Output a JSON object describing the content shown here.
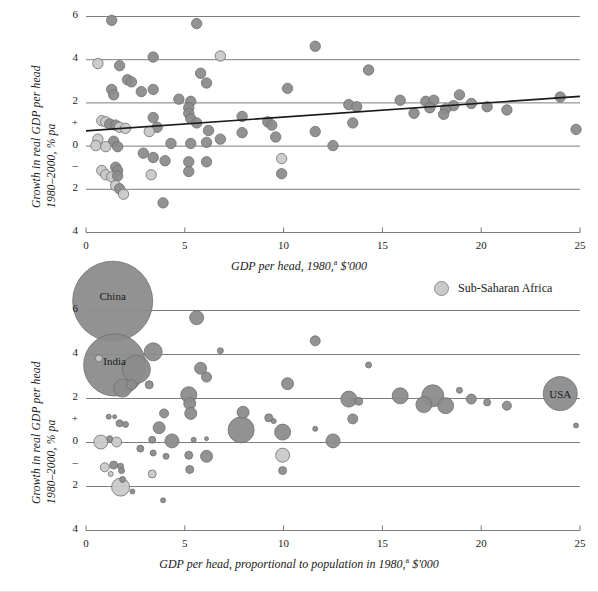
{
  "legend": {
    "label": "Sub-Saharan Africa",
    "marker_color": "#c9c9c9"
  },
  "colors": {
    "bubble_default": "#8c8c8c",
    "bubble_africa": "#c9c9c9",
    "bubble_stroke": "#6f6f6f",
    "gridline": "#7d7d7d",
    "trendline": "#1a1a1a"
  },
  "chart_data": [
    {
      "id": "top",
      "type": "scatter",
      "title": "",
      "xlabel": "GDP per head, 1980,",
      "xlabel_sup": "a",
      "xlabel_tail": " $'000",
      "ylabel_line1": "Growth in real GDP per head",
      "ylabel_line2": "1980–2000, % pa",
      "xlim": [
        0,
        25
      ],
      "ylim": [
        -4,
        6
      ],
      "xticks": [
        0,
        5,
        10,
        15,
        20,
        25
      ],
      "xticklabels": [
        "0",
        "5",
        "10",
        "15",
        "20",
        "25"
      ],
      "yticks": [
        6,
        4,
        2,
        1,
        0,
        -1,
        -2,
        -4
      ],
      "yticklabels": [
        "6",
        "4",
        "2",
        "+",
        "0",
        "–",
        "2",
        "4"
      ],
      "gridlines": [
        6,
        4,
        2,
        0,
        -2,
        -4
      ],
      "grid": true,
      "trendline": {
        "x0": 0.0,
        "y0": 0.68,
        "x1": 25.0,
        "y1": 2.28
      },
      "points": [
        {
          "x": 1.3,
          "y": 5.8,
          "g": "o"
        },
        {
          "x": 5.6,
          "y": 5.65,
          "g": "o"
        },
        {
          "x": 11.6,
          "y": 4.6,
          "g": "o"
        },
        {
          "x": 3.4,
          "y": 4.1,
          "g": "o"
        },
        {
          "x": 6.8,
          "y": 4.15,
          "g": "a"
        },
        {
          "x": 0.6,
          "y": 3.8,
          "g": "a"
        },
        {
          "x": 1.7,
          "y": 3.7,
          "g": "o"
        },
        {
          "x": 14.3,
          "y": 3.5,
          "g": "o"
        },
        {
          "x": 5.8,
          "y": 3.35,
          "g": "o"
        },
        {
          "x": 2.1,
          "y": 3.05,
          "g": "o"
        },
        {
          "x": 2.3,
          "y": 2.95,
          "g": "o"
        },
        {
          "x": 6.1,
          "y": 2.9,
          "g": "o"
        },
        {
          "x": 1.3,
          "y": 2.6,
          "g": "o"
        },
        {
          "x": 1.4,
          "y": 2.35,
          "g": "o"
        },
        {
          "x": 2.8,
          "y": 2.5,
          "g": "o"
        },
        {
          "x": 3.4,
          "y": 2.6,
          "g": "o"
        },
        {
          "x": 10.2,
          "y": 2.65,
          "g": "o"
        },
        {
          "x": 18.9,
          "y": 2.35,
          "g": "o"
        },
        {
          "x": 24.0,
          "y": 2.25,
          "g": "o"
        },
        {
          "x": 4.7,
          "y": 2.15,
          "g": "o"
        },
        {
          "x": 5.3,
          "y": 2.05,
          "g": "o"
        },
        {
          "x": 15.9,
          "y": 2.1,
          "g": "o"
        },
        {
          "x": 17.2,
          "y": 2.05,
          "g": "o"
        },
        {
          "x": 17.6,
          "y": 2.1,
          "g": "o"
        },
        {
          "x": 19.5,
          "y": 1.95,
          "g": "o"
        },
        {
          "x": 18.6,
          "y": 1.85,
          "g": "o"
        },
        {
          "x": 5.2,
          "y": 1.75,
          "g": "o"
        },
        {
          "x": 13.3,
          "y": 1.9,
          "g": "o"
        },
        {
          "x": 13.7,
          "y": 1.8,
          "g": "o"
        },
        {
          "x": 17.4,
          "y": 1.75,
          "g": "o"
        },
        {
          "x": 18.2,
          "y": 1.7,
          "g": "o"
        },
        {
          "x": 20.3,
          "y": 1.8,
          "g": "o"
        },
        {
          "x": 21.3,
          "y": 1.65,
          "g": "o"
        },
        {
          "x": 5.2,
          "y": 1.5,
          "g": "o"
        },
        {
          "x": 16.6,
          "y": 1.5,
          "g": "o"
        },
        {
          "x": 18.1,
          "y": 1.45,
          "g": "o"
        },
        {
          "x": 3.4,
          "y": 1.3,
          "g": "o"
        },
        {
          "x": 5.3,
          "y": 1.25,
          "g": "o"
        },
        {
          "x": 7.9,
          "y": 1.35,
          "g": "o"
        },
        {
          "x": 0.8,
          "y": 1.15,
          "g": "a"
        },
        {
          "x": 1.0,
          "y": 1.1,
          "g": "a"
        },
        {
          "x": 1.2,
          "y": 1.0,
          "g": "o"
        },
        {
          "x": 1.5,
          "y": 0.95,
          "g": "o"
        },
        {
          "x": 1.7,
          "y": 0.85,
          "g": "a"
        },
        {
          "x": 2.0,
          "y": 0.8,
          "g": "a"
        },
        {
          "x": 5.6,
          "y": 1.05,
          "g": "o"
        },
        {
          "x": 9.2,
          "y": 1.1,
          "g": "o"
        },
        {
          "x": 9.4,
          "y": 0.95,
          "g": "o"
        },
        {
          "x": 13.5,
          "y": 1.05,
          "g": "o"
        },
        {
          "x": 3.6,
          "y": 0.85,
          "g": "o"
        },
        {
          "x": 3.2,
          "y": 0.65,
          "g": "a"
        },
        {
          "x": 6.2,
          "y": 0.7,
          "g": "o"
        },
        {
          "x": 7.9,
          "y": 0.6,
          "g": "o"
        },
        {
          "x": 11.6,
          "y": 0.65,
          "g": "o"
        },
        {
          "x": 24.8,
          "y": 0.75,
          "g": "o"
        },
        {
          "x": 0.6,
          "y": 0.3,
          "g": "a"
        },
        {
          "x": 1.4,
          "y": 0.2,
          "g": "o"
        },
        {
          "x": 4.3,
          "y": 0.1,
          "g": "o"
        },
        {
          "x": 5.3,
          "y": 0.1,
          "g": "o"
        },
        {
          "x": 6.1,
          "y": 0.15,
          "g": "o"
        },
        {
          "x": 6.8,
          "y": 0.3,
          "g": "o"
        },
        {
          "x": 9.6,
          "y": 0.4,
          "g": "o"
        },
        {
          "x": 0.5,
          "y": 0.0,
          "g": "a"
        },
        {
          "x": 1.0,
          "y": -0.05,
          "g": "a"
        },
        {
          "x": 1.6,
          "y": -0.05,
          "g": "o"
        },
        {
          "x": 12.5,
          "y": 0.0,
          "g": "o"
        },
        {
          "x": 2.9,
          "y": -0.35,
          "g": "o"
        },
        {
          "x": 3.4,
          "y": -0.55,
          "g": "o"
        },
        {
          "x": 4.0,
          "y": -0.7,
          "g": "o"
        },
        {
          "x": 5.2,
          "y": -0.75,
          "g": "o"
        },
        {
          "x": 6.1,
          "y": -0.75,
          "g": "o"
        },
        {
          "x": 9.9,
          "y": -0.6,
          "g": "a"
        },
        {
          "x": 3.3,
          "y": -1.35,
          "g": "a"
        },
        {
          "x": 5.2,
          "y": -1.2,
          "g": "o"
        },
        {
          "x": 9.9,
          "y": -1.3,
          "g": "o"
        },
        {
          "x": 0.8,
          "y": -1.15,
          "g": "a"
        },
        {
          "x": 1.5,
          "y": -1.0,
          "g": "o"
        },
        {
          "x": 1.6,
          "y": -1.15,
          "g": "o"
        },
        {
          "x": 1.0,
          "y": -1.35,
          "g": "a"
        },
        {
          "x": 1.3,
          "y": -1.45,
          "g": "a"
        },
        {
          "x": 1.6,
          "y": -1.4,
          "g": "o"
        },
        {
          "x": 1.5,
          "y": -1.85,
          "g": "a"
        },
        {
          "x": 1.7,
          "y": -2.0,
          "g": "o"
        },
        {
          "x": 1.9,
          "y": -2.25,
          "g": "a"
        },
        {
          "x": 3.9,
          "y": -2.65,
          "g": "o"
        }
      ]
    },
    {
      "id": "bottom",
      "type": "bubble",
      "title": "",
      "xlabel": "GDP per head, proportional to population in 1980,",
      "xlabel_sup": "a",
      "xlabel_tail": " $'000",
      "ylabel_line1": "Growth in real GDP per head",
      "ylabel_line2": "1980–2000, % pa",
      "xlim": [
        0,
        25
      ],
      "ylim": [
        -4,
        6
      ],
      "xticks": [
        0,
        5,
        10,
        15,
        20,
        25
      ],
      "xticklabels": [
        "0",
        "5",
        "10",
        "15",
        "20",
        "25"
      ],
      "yticks": [
        6,
        4,
        2,
        1,
        0,
        -1,
        -2,
        -4
      ],
      "yticklabels": [
        "6",
        "4",
        "2",
        "+",
        "0",
        "–",
        "2",
        "4"
      ],
      "gridlines": [
        6,
        4,
        2,
        0,
        -2,
        -4
      ],
      "grid": true,
      "size_note": "bubble area proportional to population in 1980",
      "labeled_bubbles": [
        "China",
        "India",
        "USA"
      ],
      "points": [
        {
          "x": 1.35,
          "y": 6.4,
          "r": 40,
          "g": "o",
          "label": "China"
        },
        {
          "x": 1.45,
          "y": 3.5,
          "r": 31,
          "g": "o",
          "label": "India"
        },
        {
          "x": 24.0,
          "y": 2.2,
          "r": 17,
          "g": "o",
          "label": "USA"
        },
        {
          "x": 5.6,
          "y": 5.65,
          "r": 7,
          "g": "o"
        },
        {
          "x": 11.6,
          "y": 4.6,
          "r": 5,
          "g": "o"
        },
        {
          "x": 3.4,
          "y": 4.1,
          "r": 9,
          "g": "o"
        },
        {
          "x": 6.8,
          "y": 4.15,
          "r": 3,
          "g": "o"
        },
        {
          "x": 0.65,
          "y": 3.8,
          "r": 3.5,
          "g": "a"
        },
        {
          "x": 2.55,
          "y": 3.3,
          "r": 14,
          "g": "o"
        },
        {
          "x": 14.3,
          "y": 3.5,
          "r": 3,
          "g": "o"
        },
        {
          "x": 5.8,
          "y": 3.35,
          "r": 6,
          "g": "o"
        },
        {
          "x": 6.1,
          "y": 2.95,
          "r": 5,
          "g": "o"
        },
        {
          "x": 1.85,
          "y": 2.45,
          "r": 9,
          "g": "o"
        },
        {
          "x": 2.3,
          "y": 2.6,
          "r": 5,
          "g": "o"
        },
        {
          "x": 3.2,
          "y": 2.6,
          "r": 4,
          "g": "o"
        },
        {
          "x": 10.2,
          "y": 2.65,
          "r": 6,
          "g": "o"
        },
        {
          "x": 18.9,
          "y": 2.35,
          "r": 3,
          "g": "o"
        },
        {
          "x": 5.2,
          "y": 2.15,
          "r": 8,
          "g": "o"
        },
        {
          "x": 15.9,
          "y": 2.1,
          "r": 8,
          "g": "o"
        },
        {
          "x": 17.55,
          "y": 2.1,
          "r": 11,
          "g": "o"
        },
        {
          "x": 13.3,
          "y": 1.95,
          "r": 8,
          "g": "o"
        },
        {
          "x": 13.8,
          "y": 1.85,
          "r": 4,
          "g": "o"
        },
        {
          "x": 19.5,
          "y": 1.95,
          "r": 5,
          "g": "o"
        },
        {
          "x": 5.25,
          "y": 1.75,
          "r": 6,
          "g": "o"
        },
        {
          "x": 17.1,
          "y": 1.7,
          "r": 8,
          "g": "o"
        },
        {
          "x": 18.2,
          "y": 1.65,
          "r": 8,
          "g": "o"
        },
        {
          "x": 20.3,
          "y": 1.8,
          "r": 3.5,
          "g": "o"
        },
        {
          "x": 21.3,
          "y": 1.65,
          "r": 4.5,
          "g": "o"
        },
        {
          "x": 5.3,
          "y": 1.3,
          "r": 6,
          "g": "o"
        },
        {
          "x": 3.95,
          "y": 1.3,
          "r": 4.5,
          "g": "o"
        },
        {
          "x": 7.95,
          "y": 1.35,
          "r": 6,
          "g": "o"
        },
        {
          "x": 9.25,
          "y": 1.1,
          "r": 4,
          "g": "o"
        },
        {
          "x": 9.5,
          "y": 0.95,
          "r": 2.5,
          "g": "o"
        },
        {
          "x": 13.5,
          "y": 1.05,
          "r": 5,
          "g": "o"
        },
        {
          "x": 1.15,
          "y": 1.15,
          "r": 2.5,
          "g": "o"
        },
        {
          "x": 1.45,
          "y": 1.15,
          "r": 2,
          "g": "o"
        },
        {
          "x": 1.7,
          "y": 0.85,
          "r": 3.5,
          "g": "o"
        },
        {
          "x": 2.0,
          "y": 0.8,
          "r": 3,
          "g": "o"
        },
        {
          "x": 3.7,
          "y": 0.65,
          "r": 6,
          "g": "o"
        },
        {
          "x": 7.85,
          "y": 0.55,
          "r": 13,
          "g": "o"
        },
        {
          "x": 9.95,
          "y": 0.45,
          "r": 8,
          "g": "o"
        },
        {
          "x": 11.6,
          "y": 0.6,
          "r": 2.5,
          "g": "o"
        },
        {
          "x": 24.8,
          "y": 0.75,
          "r": 2.5,
          "g": "o"
        },
        {
          "x": 0.75,
          "y": 0.0,
          "r": 7,
          "g": "a"
        },
        {
          "x": 1.55,
          "y": 0.0,
          "r": 5,
          "g": "a"
        },
        {
          "x": 1.2,
          "y": 0.15,
          "r": 3,
          "g": "o"
        },
        {
          "x": 4.35,
          "y": 0.05,
          "r": 7,
          "g": "o"
        },
        {
          "x": 3.35,
          "y": 0.1,
          "r": 3.5,
          "g": "o"
        },
        {
          "x": 5.45,
          "y": 0.1,
          "r": 2.5,
          "g": "o"
        },
        {
          "x": 6.1,
          "y": 0.15,
          "r": 2,
          "g": "o"
        },
        {
          "x": 12.5,
          "y": 0.05,
          "r": 7,
          "g": "o"
        },
        {
          "x": 2.75,
          "y": -0.3,
          "r": 3.5,
          "g": "o"
        },
        {
          "x": 3.4,
          "y": -0.5,
          "r": 3,
          "g": "o"
        },
        {
          "x": 4.05,
          "y": -0.65,
          "r": 3,
          "g": "o"
        },
        {
          "x": 5.2,
          "y": -0.6,
          "r": 4,
          "g": "o"
        },
        {
          "x": 6.1,
          "y": -0.65,
          "r": 6,
          "g": "o"
        },
        {
          "x": 9.95,
          "y": -0.6,
          "r": 7,
          "g": "a"
        },
        {
          "x": 1.4,
          "y": -1.05,
          "r": 4,
          "g": "o"
        },
        {
          "x": 1.75,
          "y": -1.1,
          "r": 3,
          "g": "o"
        },
        {
          "x": 1.8,
          "y": -1.3,
          "r": 3,
          "g": "o"
        },
        {
          "x": 0.95,
          "y": -1.15,
          "r": 4.5,
          "g": "a"
        },
        {
          "x": 1.25,
          "y": -1.45,
          "r": 2.5,
          "g": "a"
        },
        {
          "x": 5.25,
          "y": -1.25,
          "r": 4,
          "g": "o"
        },
        {
          "x": 9.95,
          "y": -1.3,
          "r": 4,
          "g": "o"
        },
        {
          "x": 3.35,
          "y": -1.45,
          "r": 4,
          "g": "a"
        },
        {
          "x": 1.85,
          "y": -1.7,
          "r": 3,
          "g": "o"
        },
        {
          "x": 1.75,
          "y": -2.05,
          "r": 9,
          "g": "a"
        },
        {
          "x": 2.35,
          "y": -2.25,
          "r": 2.5,
          "g": "o"
        },
        {
          "x": 3.9,
          "y": -2.65,
          "r": 2.5,
          "g": "o"
        }
      ]
    }
  ]
}
